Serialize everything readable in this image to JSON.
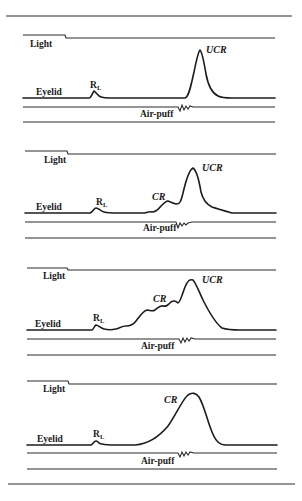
{
  "figure": {
    "colors": {
      "ink": "#1c1c1c",
      "background": "#ffffff"
    },
    "labels": {
      "light": "Light",
      "eyelid": "Eyelid",
      "air_puff": "Air-puff",
      "rl_main": "R",
      "rl_sub": "L",
      "cr": "CR",
      "ucr": "UCR"
    },
    "panels": [
      {
        "id": 1,
        "responses": [
          "RL",
          "UCR"
        ]
      },
      {
        "id": 2,
        "responses": [
          "RL",
          "CR",
          "UCR"
        ]
      },
      {
        "id": 3,
        "responses": [
          "RL",
          "CR",
          "UCR"
        ]
      },
      {
        "id": 4,
        "responses": [
          "RL",
          "CR"
        ]
      }
    ]
  }
}
